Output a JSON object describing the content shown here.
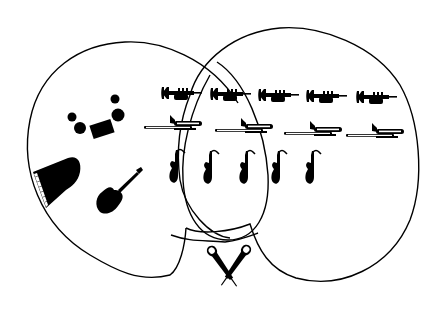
{
  "diagram": {
    "type": "instrument-venn",
    "background": "#ffffff",
    "ink": "#000000",
    "regions": [
      {
        "name": "left-region",
        "contents": [
          "drum-kit",
          "grand-piano",
          "acoustic-guitar"
        ]
      },
      {
        "name": "right-region",
        "contents": [
          "trumpets",
          "trombones",
          "saxophones"
        ]
      },
      {
        "name": "inner-oval",
        "contents": [
          "saxophones"
        ]
      },
      {
        "name": "notch-area",
        "contents": [
          "microphones"
        ]
      }
    ],
    "instruments": {
      "trumpets": [
        {
          "x": 160,
          "y": 85
        },
        {
          "x": 210,
          "y": 86
        },
        {
          "x": 258,
          "y": 87
        },
        {
          "x": 306,
          "y": 88
        },
        {
          "x": 356,
          "y": 89
        }
      ],
      "trombones": [
        {
          "x": 145,
          "y": 118
        },
        {
          "x": 215,
          "y": 122
        },
        {
          "x": 284,
          "y": 125
        },
        {
          "x": 346,
          "y": 127
        }
      ],
      "saxophones": [
        {
          "x": 172,
          "y": 148
        },
        {
          "x": 205,
          "y": 149
        },
        {
          "x": 241,
          "y": 149
        },
        {
          "x": 273,
          "y": 149
        },
        {
          "x": 306,
          "y": 149
        }
      ],
      "drum_kit": {
        "x": 70,
        "y": 95
      },
      "piano": {
        "x": 32,
        "y": 155
      },
      "guitar": {
        "x": 95,
        "y": 168
      },
      "microphones": {
        "x": 205,
        "y": 243
      }
    }
  }
}
